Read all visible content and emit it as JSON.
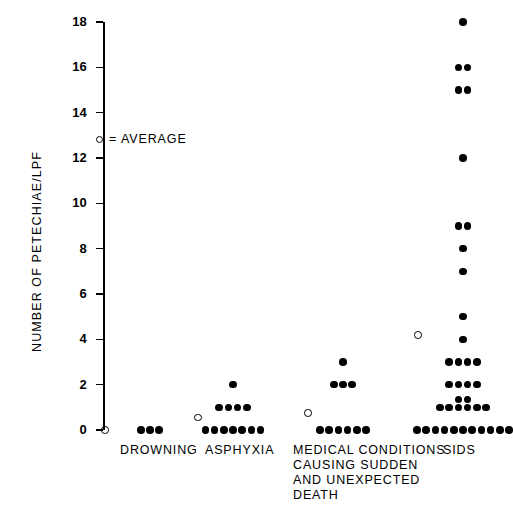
{
  "chart_data": {
    "type": "scatter",
    "title": "",
    "xlabel": "",
    "ylabel": "NUMBER OF PETECHIAE/LPF",
    "ylim": [
      0,
      18
    ],
    "yticks": [
      0,
      2,
      4,
      6,
      8,
      10,
      12,
      14,
      16,
      18
    ],
    "ytick_labels": [
      "0",
      "2",
      "4",
      "6",
      "8",
      "10",
      "12",
      "14",
      "16",
      "18"
    ],
    "grid": false,
    "legend": {
      "position": "upper-left-inside",
      "marker": "open-circle",
      "text": "= AVERAGE",
      "full_text": "○ = AVERAGE"
    },
    "categories": [
      "DROWNING",
      "ASPHYXIA",
      "MEDICAL CONDITIONS\nCAUSING SUDDEN\nAND UNEXPECTED\nDEATH",
      "SIDS"
    ],
    "category_short": [
      "DROWNING",
      "ASPHYXIA",
      "MEDICAL CONDITIONS",
      "SIDS"
    ],
    "series": [
      {
        "name": "DROWNING",
        "averages": [
          0.0
        ],
        "points": [
          {
            "value": 0,
            "count": 3
          }
        ],
        "n": 3
      },
      {
        "name": "ASPHYXIA",
        "averages": [
          0.55
        ],
        "points": [
          {
            "value": 0,
            "count": 7
          },
          {
            "value": 1,
            "count": 4
          },
          {
            "value": 2,
            "count": 1
          }
        ],
        "n": 12
      },
      {
        "name": "MEDICAL CONDITIONS CAUSING SUDDEN AND UNEXPECTED DEATH",
        "averages": [
          0.75
        ],
        "points": [
          {
            "value": 0,
            "count": 6
          },
          {
            "value": 2,
            "count": 3
          },
          {
            "value": 3,
            "count": 1
          }
        ],
        "n": 10
      },
      {
        "name": "SIDS",
        "averages": [
          4.2
        ],
        "points": [
          {
            "value": 0,
            "count": 11
          },
          {
            "value": 1,
            "count": 6
          },
          {
            "value": 1.35,
            "count": 2
          },
          {
            "value": 2,
            "count": 4
          },
          {
            "value": 3,
            "count": 4
          },
          {
            "value": 4,
            "count": 1
          },
          {
            "value": 5,
            "count": 1
          },
          {
            "value": 7,
            "count": 1
          },
          {
            "value": 8,
            "count": 1
          },
          {
            "value": 9,
            "count": 2
          },
          {
            "value": 12,
            "count": 1
          },
          {
            "value": 15,
            "count": 2
          },
          {
            "value": 16,
            "count": 2
          },
          {
            "value": 18,
            "count": 1
          }
        ],
        "n": 38
      }
    ],
    "colors": {
      "marker": "#000000",
      "axis": "#000000",
      "background": "#ffffff"
    }
  },
  "layout": {
    "plot_left": 103,
    "plot_top": 22,
    "plot_bottom": 430,
    "dot_size": 7.6,
    "avg_size": 7.6,
    "dot_spacing": 9.2,
    "category_centers": [
      150,
      233,
      343,
      463
    ],
    "avg_offsets": [
      -45,
      -35,
      -35,
      -45
    ],
    "label_positions": [
      {
        "left": 120,
        "top": 443
      },
      {
        "left": 205,
        "top": 443
      },
      {
        "left": 293,
        "top": 443
      },
      {
        "left": 443,
        "top": 443
      }
    ],
    "legend": {
      "left": 96,
      "top": 132
    },
    "y_title": {
      "left": 30,
      "top": 352
    }
  }
}
